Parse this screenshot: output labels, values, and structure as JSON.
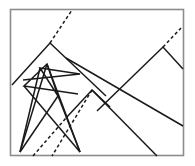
{
  "figure": {
    "background_color": "#ffffff",
    "stroke_color": "#1a1a1a",
    "frame_color": "#8c8c8c",
    "frame": {
      "x": 10.5,
      "y": 9.5,
      "width": 173,
      "height": 146
    },
    "canvas": {
      "width": 195,
      "height": 166
    },
    "stroke_width": 1.5,
    "dash_pattern": "3.2 2.6",
    "paths": [
      {
        "name": "upper-left-peak-polyline",
        "style": "solid",
        "points": "12,85 50,43 106,96"
      },
      {
        "name": "upper-left-dashed-ray",
        "style": "dashed",
        "points": "50,43 72,10"
      },
      {
        "name": "right-peak-polyline",
        "style": "solid",
        "points": "97,111 163,47 183,69"
      },
      {
        "name": "right-peak-dashed-ray",
        "style": "dashed",
        "points": "163,47 181,28"
      },
      {
        "name": "long-descending-diagonal",
        "style": "solid",
        "points": "66,58 183,126"
      },
      {
        "name": "second-descending-diagonal",
        "style": "solid",
        "points": "92,90 157,156"
      },
      {
        "name": "center-small-peak-polyline",
        "style": "solid",
        "points": "66,118 92,90 110,107"
      },
      {
        "name": "center-peak-dashed-descender",
        "style": "dashed",
        "points": "92,90 52,156"
      },
      {
        "name": "star-polyline-a",
        "style": "solid",
        "points": "23,80 80,74 40,68 58,96 47,64 24,86 78,94"
      },
      {
        "name": "fan-line-left-outer",
        "style": "solid",
        "points": "20,152 40,68"
      },
      {
        "name": "fan-line-left-inner",
        "style": "solid",
        "points": "20,152 47,64"
      },
      {
        "name": "fan-line-left-to-star-tip",
        "style": "solid",
        "points": "20,152 58,96"
      },
      {
        "name": "fan-line-right-outer",
        "style": "solid",
        "points": "80,152 47,64"
      },
      {
        "name": "fan-line-right-inner",
        "style": "solid",
        "points": "80,152 58,96"
      },
      {
        "name": "fan-line-right-to-star-base",
        "style": "solid",
        "points": "80,152 24,86"
      },
      {
        "name": "bottom-dashed-riser",
        "style": "dashed",
        "points": "33,156 66,118"
      }
    ]
  }
}
